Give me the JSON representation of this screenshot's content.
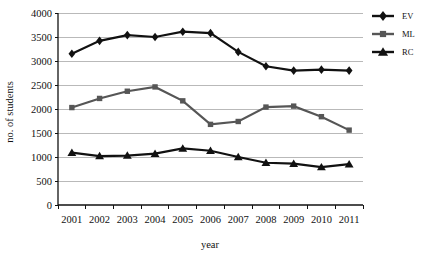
{
  "chart_data": {
    "type": "line",
    "title": "",
    "xlabel": "year",
    "ylabel": "no. of students",
    "categories": [
      "2001",
      "2002",
      "2003",
      "2004",
      "2005",
      "2006",
      "2007",
      "2008",
      "2009",
      "2010",
      "2011"
    ],
    "x": [
      2001,
      2002,
      2003,
      2004,
      2005,
      2006,
      2007,
      2008,
      2009,
      2010,
      2011
    ],
    "ylim": [
      0,
      4000
    ],
    "yticks": [
      0,
      500,
      1000,
      1500,
      2000,
      2500,
      3000,
      3500,
      4000
    ],
    "ytick_labels": [
      "0",
      "500",
      "1000",
      "1500",
      "2000",
      "2500",
      "3000",
      "3500",
      "4000"
    ],
    "grid": "horizontal",
    "legend_position": "right-top",
    "series": [
      {
        "name": "EV",
        "marker": "diamond",
        "color": "#111111",
        "values": [
          3150,
          3420,
          3540,
          3500,
          3610,
          3580,
          3190,
          2890,
          2800,
          2820,
          2800
        ]
      },
      {
        "name": "ML",
        "marker": "square",
        "color": "#565656",
        "values": [
          2030,
          2220,
          2370,
          2460,
          2170,
          1680,
          1740,
          2040,
          2060,
          1840,
          1560
        ]
      },
      {
        "name": "RC",
        "marker": "triangle",
        "color": "#111111",
        "values": [
          1090,
          1020,
          1030,
          1070,
          1180,
          1130,
          1000,
          880,
          860,
          790,
          850
        ]
      }
    ]
  },
  "legend": {
    "entries": [
      {
        "label": "EV",
        "marker": "diamond"
      },
      {
        "label": "ML",
        "marker": "square"
      },
      {
        "label": "RC",
        "marker": "triangle"
      }
    ]
  },
  "colors": {
    "gridline": "#a8a8a8",
    "axis": "#111111",
    "background": "#ffffff",
    "ev": "#111111",
    "ml": "#565656",
    "rc": "#111111"
  }
}
